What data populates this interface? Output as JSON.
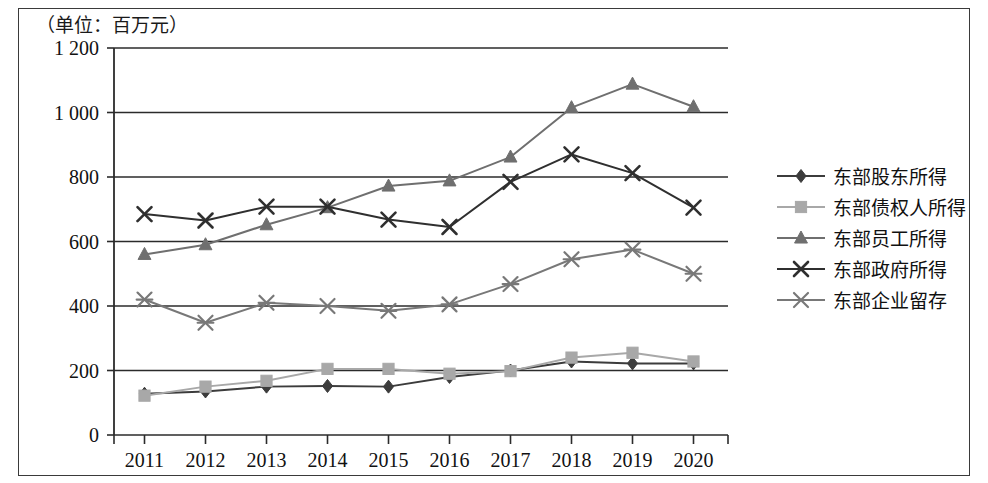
{
  "unit_label": "（单位：百万元）",
  "chart_data": {
    "type": "line",
    "title": "",
    "subtitle": "",
    "xlabel": "",
    "ylabel": "",
    "unit_note": "（单位：百万元）",
    "grid": true,
    "legend_position": "right",
    "categories": [
      "2011",
      "2012",
      "2013",
      "2014",
      "2015",
      "2016",
      "2017",
      "2018",
      "2019",
      "2020"
    ],
    "x_tick_labels": [
      "2011",
      "2012",
      "2013",
      "2014",
      "2015",
      "2016",
      "2017",
      "2018",
      "2019",
      "2020"
    ],
    "y_tick_labels": [
      "0",
      "200",
      "400",
      "600",
      "800",
      "1 000",
      "1 200"
    ],
    "y_ticks": [
      0,
      200,
      400,
      600,
      800,
      1000,
      1200
    ],
    "ylim": [
      0,
      1200
    ],
    "series": [
      {
        "name": "东部股东所得",
        "marker": "diamond",
        "color": "#3c3c3c",
        "values": [
          128,
          135,
          150,
          152,
          150,
          180,
          200,
          228,
          222,
          222
        ]
      },
      {
        "name": "东部债权人所得",
        "marker": "square",
        "color": "#a8a8a8",
        "values": [
          122,
          150,
          168,
          205,
          205,
          190,
          198,
          240,
          255,
          228
        ]
      },
      {
        "name": "东部员工所得",
        "marker": "triangle",
        "color": "#6f6f6f",
        "values": [
          560,
          590,
          652,
          705,
          772,
          788,
          862,
          1015,
          1088,
          1018
        ]
      },
      {
        "name": "东部政府所得",
        "marker": "x",
        "color": "#2f2f2f",
        "values": [
          685,
          665,
          708,
          708,
          668,
          645,
          785,
          870,
          812,
          705
        ]
      },
      {
        "name": "东部企业留存",
        "marker": "asterisk",
        "color": "#787878",
        "values": [
          420,
          348,
          410,
          400,
          385,
          405,
          468,
          545,
          575,
          500
        ]
      }
    ]
  }
}
